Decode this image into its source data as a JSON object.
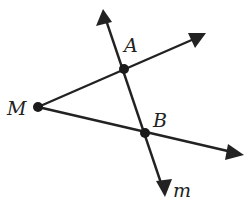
{
  "diagram": {
    "colors": {
      "stroke": "#222222",
      "point": "#1a1a1a",
      "background": "#ffffff"
    },
    "points": {
      "M": {
        "label": "M",
        "x": 38,
        "y": 107
      },
      "A": {
        "label": "A",
        "x": 124,
        "y": 69
      },
      "B": {
        "label": "B",
        "x": 145,
        "y": 133
      }
    },
    "line_m": {
      "label": "m",
      "from": {
        "x": 103,
        "y": 10
      },
      "to": {
        "x": 165,
        "y": 195
      },
      "arrows": "both"
    },
    "ray_MA": {
      "from": "M",
      "through": "A",
      "tip": {
        "x": 205,
        "y": 33
      }
    },
    "ray_MB": {
      "from": "M",
      "through": "B",
      "tip": {
        "x": 244,
        "y": 155
      }
    }
  }
}
